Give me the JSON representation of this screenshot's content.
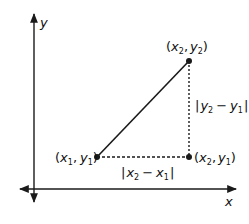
{
  "diagram": {
    "colors": {
      "stroke": "#1a1a1a",
      "background": "#ffffff"
    },
    "axes": {
      "x_label": "x",
      "y_label": "y"
    },
    "points": {
      "p1": {
        "label_var_x": "x",
        "label_sub_x": "1",
        "label_var_y": "y",
        "label_sub_y": "1",
        "text": "(x1, y1)"
      },
      "p2": {
        "label_var_x": "x",
        "label_sub_x": "2",
        "label_var_y": "y",
        "label_sub_y": "2",
        "text": "(x2, y2)"
      },
      "p3": {
        "label_var_x": "x",
        "label_sub_x": "2",
        "label_var_y": "y",
        "label_sub_y": "1",
        "text": "(x2, y1)"
      }
    },
    "distances": {
      "horizontal": {
        "var": "x",
        "sub_a": "2",
        "sub_b": "1",
        "text": "|x2 − x1|"
      },
      "vertical": {
        "var": "y",
        "sub_a": "2",
        "sub_b": "1",
        "text": "|y2 − y1|"
      }
    },
    "symbols": {
      "open_paren": "(",
      "close_paren": ")",
      "comma": ",",
      "bar": "|",
      "minus": "−"
    }
  }
}
